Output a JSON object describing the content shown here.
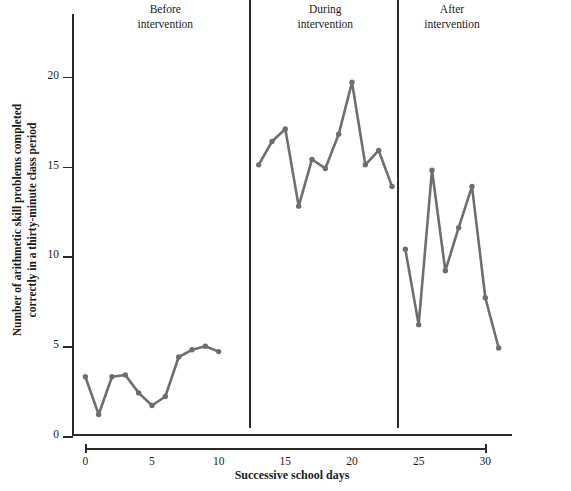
{
  "chart_data": {
    "type": "line",
    "title": "",
    "xlabel": "Successive school days",
    "ylabel": "Number of arithmetic skill problems completed correctly in a thirty-minute class period",
    "xlim": [
      -1,
      32
    ],
    "ylim": [
      0,
      23.5
    ],
    "grid": false,
    "legend": false,
    "line_color": "#6e6e6e",
    "marker_color": "#6e6e6e",
    "axis_color": "#2a2a2a",
    "y_ticks": [
      0,
      5,
      10,
      15,
      20
    ],
    "y_tick_labels": [
      "0",
      "5",
      "10",
      "15",
      "20"
    ],
    "x_ticks": [
      0,
      5,
      10,
      15,
      20,
      25,
      30
    ],
    "x_tick_labels": [
      "0",
      "5",
      "10",
      "15",
      "20",
      "25",
      "30"
    ],
    "phases": [
      {
        "name": "before",
        "label_line1": "Before",
        "label_line2": "intervention",
        "center_x": 6.0,
        "divider_x": null
      },
      {
        "name": "during",
        "label_line1": "During",
        "label_line2": "intervention",
        "center_x": 18.0,
        "divider_x": 12.3
      },
      {
        "name": "after",
        "label_line1": "After",
        "label_line2": "intervention",
        "center_x": 27.5,
        "divider_x": 23.4
      }
    ],
    "series": [
      {
        "name": "Before intervention",
        "x": [
          0,
          1,
          2,
          3,
          4,
          5,
          6,
          7,
          8,
          9,
          10
        ],
        "values": [
          3.3,
          1.2,
          3.3,
          3.4,
          2.4,
          1.7,
          2.2,
          4.4,
          4.8,
          5.0,
          4.7
        ]
      },
      {
        "name": "During intervention",
        "x": [
          13,
          14,
          15,
          16,
          17,
          18,
          19,
          20,
          21,
          22,
          23
        ],
        "values": [
          15.1,
          16.4,
          17.1,
          12.8,
          15.4,
          14.9,
          16.8,
          19.7,
          15.1,
          15.9,
          13.9
        ]
      },
      {
        "name": "After intervention",
        "x": [
          24,
          25,
          26,
          27,
          28,
          29,
          30,
          31
        ],
        "values": [
          10.4,
          6.2,
          14.8,
          9.2,
          11.6,
          13.9,
          7.7,
          4.9
        ]
      }
    ]
  }
}
